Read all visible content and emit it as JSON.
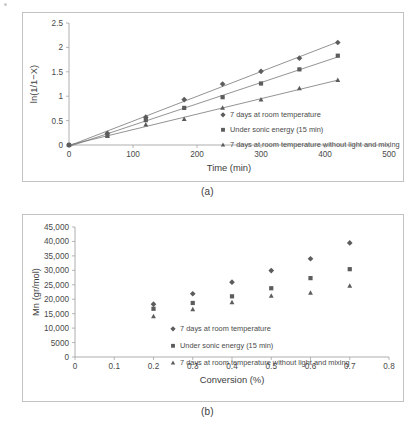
{
  "figure": {
    "caption_a": "(a)",
    "caption_b": "(b)"
  },
  "chart_data": [
    {
      "id": "chart-a",
      "type": "scatter",
      "title": "",
      "xlabel": "Time (min)",
      "ylabel": "ln(1/1−X)",
      "xlim": [
        0,
        500
      ],
      "ylim": [
        0,
        2.5
      ],
      "xticks": [
        0,
        100,
        200,
        300,
        400,
        500
      ],
      "yticks": [
        0,
        0.5,
        1,
        1.5,
        2,
        2.5
      ],
      "xtick_labels": [
        "0",
        "100",
        "200",
        "300",
        "400",
        "500"
      ],
      "ytick_labels": [
        "0",
        "0.5",
        "1",
        "1.5",
        "2",
        "2.5"
      ],
      "grid": false,
      "legend_position": "inside-right",
      "series": [
        {
          "name": "7 days at room temperature",
          "marker": "diamond",
          "color": "#5c5c5c",
          "trendline": true,
          "x": [
            0,
            60,
            120,
            180,
            240,
            300,
            360,
            420
          ],
          "y": [
            0,
            0.24,
            0.57,
            0.93,
            1.25,
            1.51,
            1.78,
            2.1
          ]
        },
        {
          "name": "Under sonic energy (15 min)",
          "marker": "square",
          "color": "#4f4f4f",
          "trendline": true,
          "x": [
            0,
            60,
            120,
            180,
            240,
            300,
            360,
            420
          ],
          "y": [
            0,
            0.2,
            0.51,
            0.76,
            0.98,
            1.26,
            1.55,
            1.83
          ]
        },
        {
          "name": "7 days at room temperature without light and mixing",
          "marker": "triangle",
          "color": "#8a8a8a",
          "trendline": true,
          "x": [
            0,
            60,
            120,
            180,
            240,
            300,
            360,
            420
          ],
          "y": [
            0,
            0.18,
            0.42,
            0.53,
            0.76,
            0.93,
            1.16,
            1.33
          ]
        }
      ]
    },
    {
      "id": "chart-b",
      "type": "scatter",
      "title": "",
      "xlabel": "Conversion (%)",
      "ylabel": "Mn (gr/mol)",
      "xlim": [
        0,
        0.8
      ],
      "ylim": [
        0,
        45000
      ],
      "xticks": [
        0,
        0.1,
        0.2,
        0.3,
        0.4,
        0.5,
        0.6,
        0.7,
        0.8
      ],
      "yticks": [
        0,
        5000,
        10000,
        15000,
        20000,
        25000,
        30000,
        35000,
        40000,
        45000
      ],
      "xtick_labels": [
        "0",
        "0.1",
        "0.2",
        "0.3",
        "0.4",
        "0.5",
        "0.6",
        "0.7",
        "0.8"
      ],
      "ytick_labels": [
        "0",
        "5000",
        "10,000",
        "15,000",
        "20,000",
        "25,000",
        "30,000",
        "35,000",
        "40,000",
        "45,000"
      ],
      "grid": false,
      "legend_position": "inside-center",
      "series": [
        {
          "name": "7 days at room temperature",
          "marker": "diamond",
          "color": "#5c5c5c",
          "trendline": false,
          "x": [
            0.2,
            0.3,
            0.4,
            0.5,
            0.6,
            0.7
          ],
          "y": [
            18300,
            21900,
            25900,
            29900,
            34000,
            39500
          ]
        },
        {
          "name": "Under sonic energy (15 min)",
          "marker": "square",
          "color": "#4f4f4f",
          "trendline": false,
          "x": [
            0.2,
            0.3,
            0.4,
            0.5,
            0.6,
            0.7
          ],
          "y": [
            16700,
            18700,
            21000,
            23800,
            27300,
            30400
          ]
        },
        {
          "name": "7 days at room temperature without light and mixing",
          "marker": "triangle",
          "color": "#8a8a8a",
          "trendline": false,
          "x": [
            0.2,
            0.3,
            0.4,
            0.5,
            0.6,
            0.7
          ],
          "y": [
            14100,
            16500,
            18900,
            21200,
            22200,
            24600
          ]
        }
      ]
    }
  ]
}
